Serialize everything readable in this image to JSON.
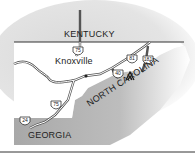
{
  "map": {
    "states": [
      {
        "name": "KENTUCKY"
      },
      {
        "name": "NORTH CAROLINA"
      },
      {
        "name": "GEORGIA"
      }
    ],
    "cities": [
      {
        "name": "Knoxville"
      }
    ],
    "highways": [
      {
        "label": "75",
        "pos": "north"
      },
      {
        "label": "81"
      },
      {
        "label": "181"
      },
      {
        "label": "40"
      },
      {
        "label": "75",
        "pos": "south"
      },
      {
        "label": "24"
      }
    ],
    "marker": {
      "icon": "tent-icon"
    },
    "colors": {
      "background_shadow": "#c8c8c8",
      "land": "#ffffff",
      "neighbor_state": "#b3b3b3",
      "roads": "#555555",
      "border": "#333333"
    }
  }
}
